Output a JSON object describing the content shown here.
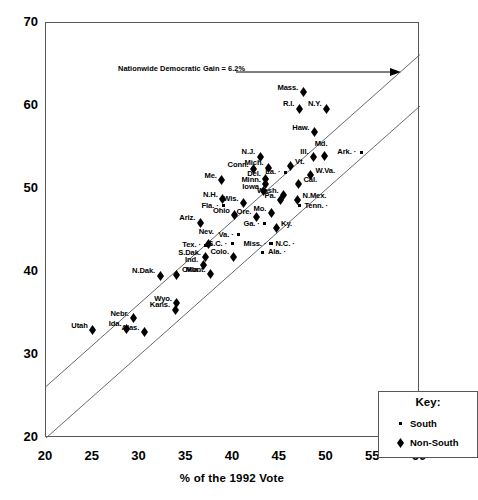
{
  "chart_data": {
    "type": "scatter",
    "title": "",
    "xlabel": "% of the 1992 Vote",
    "ylabel": "% of the 1996 Vote",
    "xlim": [
      20,
      60
    ],
    "ylim": [
      20,
      70
    ],
    "xticks": [
      20,
      25,
      30,
      35,
      40,
      45,
      50,
      55,
      60
    ],
    "yticks": [
      20,
      30,
      40,
      50,
      60,
      70
    ],
    "grid": false,
    "annotations": [
      {
        "text": "Nationwide Democratic Gain = 6.2%",
        "type": "arrow-label"
      }
    ],
    "reference_lines": [
      {
        "name": "parity",
        "intercept": 0,
        "slope": 1
      },
      {
        "name": "uniform-gain",
        "intercept": 6.2,
        "slope": 1
      }
    ],
    "legend": {
      "title": "Key:",
      "position": "bottom-right",
      "entries": [
        {
          "label": "South",
          "marker": "dot"
        },
        {
          "label": "Non-South",
          "marker": "diamond"
        }
      ]
    },
    "points": [
      {
        "label": "Mass.",
        "x": 47.5,
        "y": 62.2,
        "group": "Non-South",
        "label_pos": "left"
      },
      {
        "label": "R.I.",
        "x": 47.1,
        "y": 60.2,
        "group": "Non-South",
        "label_pos": "left"
      },
      {
        "label": "N.Y.",
        "x": 50.0,
        "y": 60.2,
        "group": "Non-South",
        "label_pos": "left"
      },
      {
        "label": "Haw.",
        "x": 48.7,
        "y": 57.4,
        "group": "Non-South",
        "label_pos": "left"
      },
      {
        "label": "Md.",
        "x": 49.8,
        "y": 54.5,
        "group": "Non-South",
        "label_pos": "above"
      },
      {
        "label": "Ill.",
        "x": 48.6,
        "y": 54.4,
        "group": "Non-South",
        "label_pos": "left"
      },
      {
        "label": "Ark.",
        "x": 53.7,
        "y": 54.4,
        "group": "South",
        "label_pos": "left"
      },
      {
        "label": "N.J.",
        "x": 42.9,
        "y": 54.4,
        "group": "Non-South",
        "label_pos": "left"
      },
      {
        "label": "Vt.",
        "x": 46.1,
        "y": 53.3,
        "group": "Non-South",
        "label_pos": "right"
      },
      {
        "label": "Mich.",
        "x": 43.8,
        "y": 53.1,
        "group": "Non-South",
        "label_pos": "left"
      },
      {
        "label": "Conn.",
        "x": 42.2,
        "y": 52.9,
        "group": "Non-South",
        "label_pos": "left"
      },
      {
        "label": "W.Va.",
        "x": 48.3,
        "y": 52.2,
        "group": "Non-South",
        "label_pos": "right"
      },
      {
        "label": "La.",
        "x": 45.6,
        "y": 52.0,
        "group": "South",
        "label_pos": "left"
      },
      {
        "label": "Del.",
        "x": 43.5,
        "y": 51.8,
        "group": "Non-South",
        "label_pos": "left"
      },
      {
        "label": "Me.",
        "x": 38.8,
        "y": 51.6,
        "group": "Non-South",
        "label_pos": "left"
      },
      {
        "label": "Cal.",
        "x": 47.0,
        "y": 51.1,
        "group": "Non-South",
        "label_pos": "right"
      },
      {
        "label": "Minn.",
        "x": 43.5,
        "y": 51.1,
        "group": "Non-South",
        "label_pos": "left"
      },
      {
        "label": "Wash.",
        "x": 45.4,
        "y": 49.8,
        "group": "Non-South",
        "label_pos": "left"
      },
      {
        "label": "Iowa",
        "x": 43.3,
        "y": 50.3,
        "group": "Non-South",
        "label_pos": "left"
      },
      {
        "label": "Pa.",
        "x": 45.1,
        "y": 49.2,
        "group": "Non-South",
        "label_pos": "left"
      },
      {
        "label": "N.Mex.",
        "x": 46.9,
        "y": 49.2,
        "group": "Non-South",
        "label_pos": "right"
      },
      {
        "label": "Wis.",
        "x": 41.1,
        "y": 48.8,
        "group": "Non-South",
        "label_pos": "left"
      },
      {
        "label": "N.H.",
        "x": 38.9,
        "y": 49.3,
        "group": "Non-South",
        "label_pos": "left"
      },
      {
        "label": "Tenn.",
        "x": 47.1,
        "y": 48.0,
        "group": "South",
        "label_pos": "right"
      },
      {
        "label": "Mo.",
        "x": 44.1,
        "y": 47.6,
        "group": "Non-South",
        "label_pos": "left"
      },
      {
        "label": "Fla.",
        "x": 39.0,
        "y": 48.0,
        "group": "South",
        "label_pos": "left"
      },
      {
        "label": "Ore.",
        "x": 42.5,
        "y": 47.2,
        "group": "Non-South",
        "label_pos": "left"
      },
      {
        "label": "Ohio",
        "x": 40.2,
        "y": 47.4,
        "group": "Non-South",
        "label_pos": "left"
      },
      {
        "label": "Ariz.",
        "x": 36.5,
        "y": 46.5,
        "group": "Non-South",
        "label_pos": "left"
      },
      {
        "label": "Ky.",
        "x": 44.6,
        "y": 45.8,
        "group": "Non-South",
        "label_pos": "right"
      },
      {
        "label": "Ga.",
        "x": 43.4,
        "y": 45.8,
        "group": "South",
        "label_pos": "left"
      },
      {
        "label": "Va.",
        "x": 40.6,
        "y": 44.5,
        "group": "South",
        "label_pos": "left"
      },
      {
        "label": "Nev.",
        "x": 37.4,
        "y": 43.9,
        "group": "Non-South",
        "label_pos": "above"
      },
      {
        "label": "Miss.",
        "x": 44.1,
        "y": 43.4,
        "group": "South",
        "label_pos": "left"
      },
      {
        "label": "N.C.",
        "x": 44.0,
        "y": 43.4,
        "group": "South",
        "label_pos": "right"
      },
      {
        "label": "S.C.",
        "x": 39.9,
        "y": 43.4,
        "group": "South",
        "label_pos": "left"
      },
      {
        "label": "Tex.",
        "x": 37.1,
        "y": 43.2,
        "group": "South",
        "label_pos": "left"
      },
      {
        "label": "Ala.",
        "x": 43.2,
        "y": 42.4,
        "group": "South",
        "label_pos": "right"
      },
      {
        "label": "Colo.",
        "x": 40.1,
        "y": 42.4,
        "group": "Non-South",
        "label_pos": "left"
      },
      {
        "label": "S.Dak.",
        "x": 37.1,
        "y": 42.3,
        "group": "Non-South",
        "label_pos": "left"
      },
      {
        "label": "Ind.",
        "x": 36.8,
        "y": 41.4,
        "group": "Non-South",
        "label_pos": "left"
      },
      {
        "label": "Mont.",
        "x": 37.6,
        "y": 40.3,
        "group": "Non-South",
        "label_pos": "left"
      },
      {
        "label": "Okla.",
        "x": 34.0,
        "y": 40.2,
        "group": "Non-South",
        "label_pos": "right"
      },
      {
        "label": "N.Dak.",
        "x": 32.2,
        "y": 40.1,
        "group": "Non-South",
        "label_pos": "left"
      },
      {
        "label": "Wyo.",
        "x": 34.0,
        "y": 36.8,
        "group": "Non-South",
        "label_pos": "left"
      },
      {
        "label": "Kans.",
        "x": 33.8,
        "y": 36.0,
        "group": "Non-South",
        "label_pos": "left"
      },
      {
        "label": "Nebr.",
        "x": 29.4,
        "y": 35.0,
        "group": "Non-South",
        "label_pos": "left"
      },
      {
        "label": "Ida.",
        "x": 28.6,
        "y": 33.7,
        "group": "Non-South",
        "label_pos": "left"
      },
      {
        "label": "Alas.",
        "x": 30.5,
        "y": 33.3,
        "group": "Non-South",
        "label_pos": "left"
      },
      {
        "label": "Utah",
        "x": 25.0,
        "y": 33.5,
        "group": "Non-South",
        "label_pos": "left"
      }
    ]
  },
  "axes": {
    "y_title": "% of the 1996 Vote",
    "x_title": "% of the 1992 Vote",
    "y_ticks": [
      "70",
      "60",
      "50",
      "40",
      "30",
      "20"
    ],
    "x_ticks": [
      "20",
      "25",
      "30",
      "35",
      "40",
      "45",
      "50",
      "55",
      "60"
    ]
  },
  "annotation": {
    "gain_text": "Nationwide Democratic Gain = 6.2%"
  },
  "key": {
    "title": "Key:",
    "south_label": "South",
    "nonsouth_label": "Non-South"
  }
}
